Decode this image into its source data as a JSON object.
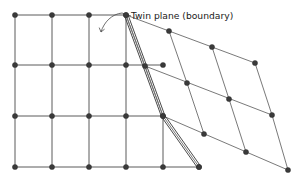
{
  "figure": {
    "kind": "crystal-twin-lattice-diagram",
    "width": 298,
    "height": 192,
    "background_color": "#ffffff"
  },
  "annotations": [
    {
      "id": "twin-plane-label",
      "text": "Twin plane (boundary)",
      "x": 131,
      "y": 19,
      "font_size": 9.2,
      "color": "#1a1a1a",
      "anchor": "start"
    }
  ],
  "leader": {
    "color": "#4a4a4a",
    "stub_path": "M 131 16 L 122 13",
    "curve_path": "M 122 13 C 112 14 104 22 101 32",
    "arrow_path": "M 101 32 L 99.2 27.6 M 101 32 L 104.6 29.1"
  },
  "twin_boundary": {
    "color": "#4a4a4a",
    "style": "double-line",
    "offset_px": 1.9,
    "vertices": [
      [
        126,
        15
      ],
      [
        163,
        116
      ],
      [
        199,
        167
      ]
    ],
    "rail_a": "M 124.6 15.9 L 161.6 116.9 L 197.6 167.9",
    "rail_b": "M 127.9 14.6 L 164.9 115.6 L 200.9 166.6"
  },
  "parent_lattice": {
    "name": "untwinned-square-lattice",
    "line_color": "#5a5a5a",
    "node_color": "#3a3a3a",
    "node_radius": 2.6,
    "columns_x": [
      15,
      52,
      89,
      126,
      163
    ],
    "rows_y": [
      15,
      65,
      116,
      167
    ],
    "horizontal_segments": [
      "M 15 15 L 126 15",
      "M 15 65 L 163 65",
      "M 15 116 L 163 116",
      "M 15 167 L 199 167"
    ],
    "vertical_segments": [
      "M 15 15 L 15 167",
      "M 52 15 L 52 167",
      "M 89 15 L 89 167",
      "M 126 15 L 126 167",
      "M 163 116 L 163 167"
    ],
    "nodes": [
      [
        15,
        15
      ],
      [
        52,
        15
      ],
      [
        89,
        15
      ],
      [
        126,
        15
      ],
      [
        15,
        65
      ],
      [
        52,
        65
      ],
      [
        89,
        65
      ],
      [
        126,
        65
      ],
      [
        163,
        65
      ],
      [
        15,
        116
      ],
      [
        52,
        116
      ],
      [
        89,
        116
      ],
      [
        126,
        116
      ],
      [
        163,
        116
      ],
      [
        15,
        167
      ],
      [
        52,
        167
      ],
      [
        89,
        167
      ],
      [
        126,
        167
      ],
      [
        163,
        167
      ],
      [
        199,
        167
      ]
    ]
  },
  "twin_lattice": {
    "name": "twinned-sheared-lattice",
    "line_color": "#6a6a6a",
    "node_color": "#3a3a3a",
    "node_radius": 2.6,
    "rows": [
      [
        [
          126,
          15
        ],
        [
          169,
          31
        ],
        [
          212,
          47
        ],
        [
          255,
          63
        ]
      ],
      [
        [
          145,
          66
        ],
        [
          187,
          83
        ],
        [
          229,
          99
        ],
        [
          272,
          115
        ]
      ],
      [
        [
          163,
          116
        ],
        [
          204,
          134
        ],
        [
          246,
          152
        ],
        [
          288,
          170
        ]
      ]
    ],
    "band_lines": [
      "M 126 15 L 255 63",
      "M 145 66 L 272 115",
      "M 163 116 L 288 170"
    ],
    "rib_lines": [
      "M 126 15 L 145 66",
      "M 169 31 L 187 83",
      "M 212 47 L 229 99",
      "M 255 63 L 272 115",
      "M 145 66 L 163 116",
      "M 187 83 L 204 134",
      "M 229 99 L 246 152",
      "M 272 115 L 288 170"
    ],
    "wedge_lines": [
      "M 126 15 L 163 116",
      "M 163 116 L 199 167"
    ],
    "nodes": [
      [
        126,
        15
      ],
      [
        169,
        31
      ],
      [
        212,
        47
      ],
      [
        255,
        63
      ],
      [
        145,
        66
      ],
      [
        187,
        83
      ],
      [
        229,
        99
      ],
      [
        272,
        115
      ],
      [
        163,
        116
      ],
      [
        204,
        134
      ],
      [
        246,
        152
      ],
      [
        288,
        170
      ],
      [
        199,
        167
      ]
    ]
  }
}
